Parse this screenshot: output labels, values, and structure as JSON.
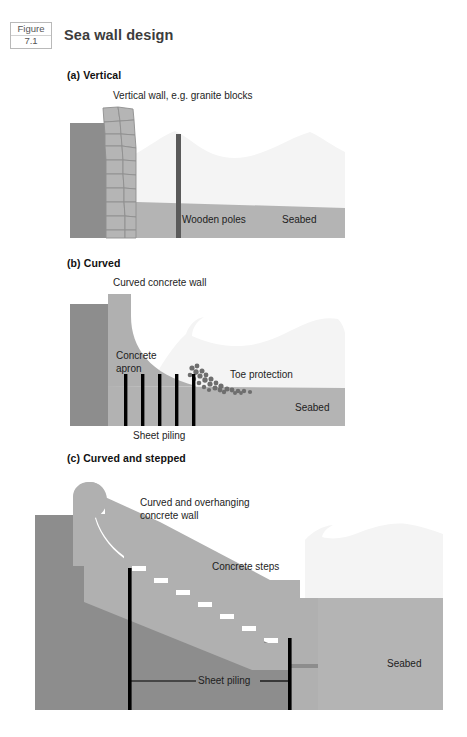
{
  "figure": {
    "badge_word": "Figure",
    "badge_number": "7.1",
    "title": "Sea wall design"
  },
  "colors": {
    "land": "#8d8d8d",
    "land_dark": "#868686",
    "concrete": "#b0b0b0",
    "block_fill": "#b5b5b5",
    "block_stroke": "#8e8e8e",
    "water": "#f4f4f4",
    "water_edge": "#ededed",
    "seabed": "#b4b4b4",
    "pole": "#5a5a5a",
    "piling": "#000000",
    "rubble": "#6e6e6e",
    "text": "#1d1d1d"
  },
  "panels": [
    {
      "id": "vertical",
      "heading": "(a) Vertical",
      "labels": [
        {
          "name": "vertical-wall-label",
          "text": "Vertical wall, e.g. granite blocks"
        },
        {
          "name": "wooden-poles-label",
          "text": "Wooden poles"
        },
        {
          "name": "seabed-label",
          "text": "Seabed"
        }
      ]
    },
    {
      "id": "curved",
      "heading": "(b) Curved",
      "labels": [
        {
          "name": "curved-concrete-wall-label",
          "text": "Curved concrete wall"
        },
        {
          "name": "concrete-apron-label",
          "text": "Concrete\napron"
        },
        {
          "name": "toe-protection-label",
          "text": "Toe protection"
        },
        {
          "name": "seabed-label",
          "text": "Seabed"
        },
        {
          "name": "sheet-piling-label",
          "text": "Sheet piling"
        }
      ],
      "sheet_piling_count": 5
    },
    {
      "id": "curved-stepped",
      "heading": "(c) Curved and stepped",
      "labels": [
        {
          "name": "curved-overhanging-wall-label",
          "text": "Curved and overhanging\nconcrete wall"
        },
        {
          "name": "concrete-steps-label",
          "text": "Concrete steps"
        },
        {
          "name": "seabed-label",
          "text": "Seabed"
        },
        {
          "name": "sheet-piling-label",
          "text": "Sheet piling"
        }
      ],
      "step_count": 9
    }
  ]
}
